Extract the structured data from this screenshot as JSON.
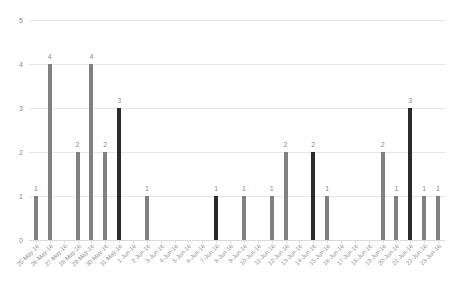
{
  "chart_data": {
    "type": "bar",
    "title": "",
    "subtitle": "",
    "xlabel": "",
    "ylabel": "",
    "ylim": [
      0,
      5
    ],
    "yticks": [
      0,
      1,
      2,
      3,
      4,
      5
    ],
    "ytick_labels": [
      "0",
      "1",
      "2",
      "3",
      "4",
      "5"
    ],
    "grid": true,
    "legend": "none",
    "bar_colors": {
      "gray": "#808080",
      "dark": "#2b2b2b"
    },
    "categories": [
      "25-May-16",
      "26-May-16",
      "27-May-16",
      "28-May-16",
      "29-May-16",
      "30-May-16",
      "31-May-16",
      "1-Jun-16",
      "2-Jun-16",
      "3-Jun-16",
      "4-Jun-16",
      "5-Jun-16",
      "6-Jun-16",
      "7-Jun-16",
      "8-Jun-16",
      "9-Jun-16",
      "10-Jun-16",
      "11-Jun-16",
      "12-Jun-16",
      "13-Jun-16",
      "14-Jun-16",
      "15-Jun-16",
      "16-Jun-16",
      "17-Jun-16",
      "18-Jun-16",
      "19-Jun-16",
      "20-Jun-16",
      "21-Jun-16",
      "22-Jun-16",
      "23-Jun-16"
    ],
    "values": [
      1,
      4,
      0,
      2,
      4,
      2,
      3,
      0,
      1,
      0,
      0,
      0,
      0,
      1,
      0,
      1,
      0,
      1,
      2,
      0,
      2,
      1,
      0,
      0,
      0,
      2,
      1,
      3,
      1,
      1
    ],
    "value_labels": [
      "1",
      "4",
      "",
      "2",
      "4",
      "2",
      "3",
      "",
      "1",
      "",
      "",
      "",
      "",
      "1",
      "",
      "1",
      "",
      "1",
      "2",
      "",
      "2",
      "1",
      "",
      "",
      "",
      "2",
      "1",
      "3",
      "1",
      "1"
    ],
    "point_colors": [
      "gray",
      "gray",
      "gray",
      "gray",
      "gray",
      "gray",
      "dark",
      "gray",
      "gray",
      "gray",
      "gray",
      "gray",
      "gray",
      "dark",
      "gray",
      "gray",
      "gray",
      "gray",
      "gray",
      "gray",
      "dark",
      "gray",
      "gray",
      "gray",
      "gray",
      "gray",
      "gray",
      "dark",
      "gray",
      "gray"
    ]
  }
}
